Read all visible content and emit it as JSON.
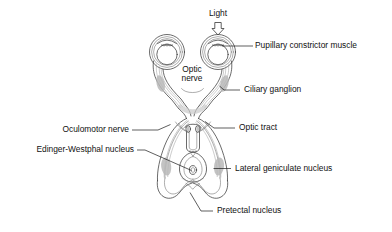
{
  "figure": {
    "background_color": "#ffffff",
    "line_color": "#3a3a3a",
    "shade_color": "#b9b9b9",
    "text_color": "#111111"
  },
  "labels": {
    "light": "Light",
    "pupillary_constrictor_muscle": "Pupillary constrictor muscle",
    "optic_nerve_line1": "Optic",
    "optic_nerve_line2": "nerve",
    "ciliary_ganglion": "Ciliary ganglion",
    "oculomotor_nerve": "Oculomotor nerve",
    "optic_tract": "Optic tract",
    "edinger_westphal_nucleus": "Edinger-Westphal nucleus",
    "lateral_geniculate_nucleus": "Lateral geniculate nucleus",
    "pretectal_nucleus": "Pretectal nucleus"
  },
  "icons": {
    "light_arrow": "down-arrow-icon"
  }
}
